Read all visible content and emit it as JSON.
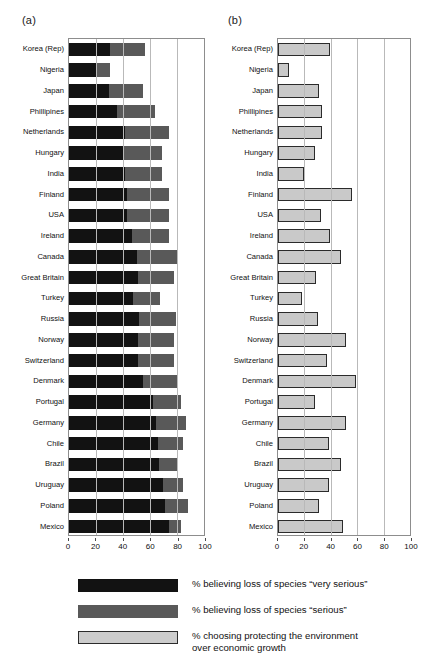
{
  "panels": {
    "a": {
      "label": "(a)"
    },
    "b": {
      "label": "(b)"
    }
  },
  "axis": {
    "ticks": [
      "0",
      "20",
      "40",
      "60",
      "80",
      "100"
    ],
    "min": 0,
    "max": 100
  },
  "legend": {
    "items": [
      {
        "swatch": "very-serious",
        "color": "#121212",
        "text": "% believing loss of species “very serious”"
      },
      {
        "swatch": "serious",
        "color": "#595959",
        "text": "% believing loss of species “serious”"
      },
      {
        "swatch": "environment",
        "color": "#cccccc",
        "text": "% choosing protecting the environment\nover economic growth"
      }
    ]
  },
  "chart_data": [
    {
      "type": "bar",
      "id": "panel-a",
      "title": "(a)",
      "orientation": "horizontal",
      "stacked": true,
      "xlabel": "",
      "ylabel": "",
      "xlim": [
        0,
        100
      ],
      "xticks": [
        0,
        20,
        40,
        60,
        80,
        100
      ],
      "grid": true,
      "categories": [
        "Korea (Rep)",
        "Nigeria",
        "Japan",
        "Phillipines",
        "Netherlands",
        "Hungary",
        "India",
        "Finland",
        "USA",
        "Ireland",
        "Canada",
        "Great Britain",
        "Turkey",
        "Russia",
        "Norway",
        "Switzerland",
        "Denmark",
        "Portugal",
        "Germany",
        "Chile",
        "Brazil",
        "Uruguay",
        "Poland",
        "Mexico"
      ],
      "series": [
        {
          "name": "% believing loss of species “very serious”",
          "color": "#121212",
          "values": [
            40,
            38,
            40,
            44,
            48,
            48,
            50,
            50,
            50,
            54,
            56,
            58,
            58,
            58,
            58,
            58,
            61,
            68,
            69,
            72,
            74,
            76,
            76,
            81
          ]
        },
        {
          "name": "% believing loss of species “serious”",
          "color": "#595959",
          "values": [
            35,
            17,
            34,
            36,
            38,
            35,
            33,
            36,
            36,
            32,
            34,
            30,
            24,
            31,
            30,
            30,
            29,
            23,
            24,
            20,
            16,
            16,
            18,
            10
          ]
        }
      ],
      "totals": [
        75,
        55,
        74,
        80,
        86,
        83,
        83,
        86,
        86,
        86,
        90,
        88,
        82,
        89,
        88,
        88,
        90,
        91,
        93,
        92,
        90,
        92,
        94,
        91
      ]
    },
    {
      "type": "bar",
      "id": "panel-b",
      "title": "(b)",
      "orientation": "horizontal",
      "stacked": false,
      "xlabel": "",
      "ylabel": "",
      "xlim": [
        0,
        100
      ],
      "xticks": [
        0,
        20,
        40,
        60,
        80,
        100
      ],
      "grid": true,
      "categories": [
        "Korea (Rep)",
        "Nigeria",
        "Japan",
        "Phillipines",
        "Netherlands",
        "Hungary",
        "India",
        "Finland",
        "USA",
        "Ireland",
        "Canada",
        "Great Britain",
        "Turkey",
        "Russia",
        "Norway",
        "Switzerland",
        "Denmark",
        "Portugal",
        "Germany",
        "Chile",
        "Brazil",
        "Uruguay",
        "Poland",
        "Mexico"
      ],
      "series": [
        {
          "name": "% choosing protecting the environment over economic growth",
          "color": "#c9c9c9",
          "values": [
            63,
            29,
            56,
            58,
            58,
            53,
            44,
            75,
            57,
            63,
            69,
            54,
            43,
            55,
            72,
            61,
            77,
            53,
            72,
            62,
            69,
            62,
            56,
            70
          ]
        }
      ]
    }
  ]
}
